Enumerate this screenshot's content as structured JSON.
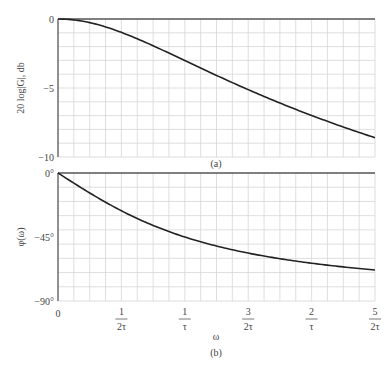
{
  "chart_data": [
    {
      "type": "line",
      "title": "",
      "caption": "(a)",
      "xlabel": "",
      "ylabel": "20 log|G|, db",
      "ylim": [
        -10,
        0
      ],
      "xlim": [
        0,
        2.5
      ],
      "grid": true,
      "yticks": [
        {
          "v": 0,
          "label": "0"
        },
        {
          "v": -5,
          "label": "−5"
        },
        {
          "v": -10,
          "label": "−10"
        }
      ],
      "series": [
        {
          "name": "magnitude",
          "x": [
            0,
            0.25,
            0.5,
            0.75,
            1.0,
            1.25,
            1.5,
            1.75,
            2.0,
            2.25,
            2.5
          ],
          "values": [
            0,
            -0.26,
            -0.97,
            -1.94,
            -3.01,
            -4.08,
            -5.12,
            -6.09,
            -6.99,
            -7.82,
            -8.6
          ]
        }
      ]
    },
    {
      "type": "line",
      "title": "",
      "caption": "(b)",
      "xlabel": "ω",
      "ylabel": "φ(ω)",
      "ylim": [
        -90,
        0
      ],
      "xlim": [
        0,
        2.5
      ],
      "grid": true,
      "yticks": [
        {
          "v": 0,
          "label": "0°"
        },
        {
          "v": -45,
          "label": "−45°"
        },
        {
          "v": -90,
          "label": "−90°"
        }
      ],
      "xticks": [
        {
          "v": 0,
          "num": "0",
          "den": ""
        },
        {
          "v": 0.5,
          "num": "1",
          "den": "2τ"
        },
        {
          "v": 1.0,
          "num": "1",
          "den": "τ"
        },
        {
          "v": 1.5,
          "num": "3",
          "den": "2τ"
        },
        {
          "v": 2.0,
          "num": "2",
          "den": "τ"
        },
        {
          "v": 2.5,
          "num": "5",
          "den": "2τ"
        }
      ],
      "series": [
        {
          "name": "phase",
          "x": [
            0,
            0.25,
            0.5,
            0.75,
            1.0,
            1.25,
            1.5,
            1.75,
            2.0,
            2.25,
            2.5
          ],
          "values": [
            0,
            -14.0,
            -26.6,
            -36.9,
            -45.0,
            -51.3,
            -56.3,
            -60.3,
            -63.4,
            -66.0,
            -68.2
          ]
        }
      ]
    }
  ],
  "labels": {
    "top_ylabel": "20 log|G|, db",
    "bottom_ylabel": "φ(ω)",
    "xlabel": "ω",
    "caption_a": "(a)",
    "caption_b": "(b)"
  }
}
